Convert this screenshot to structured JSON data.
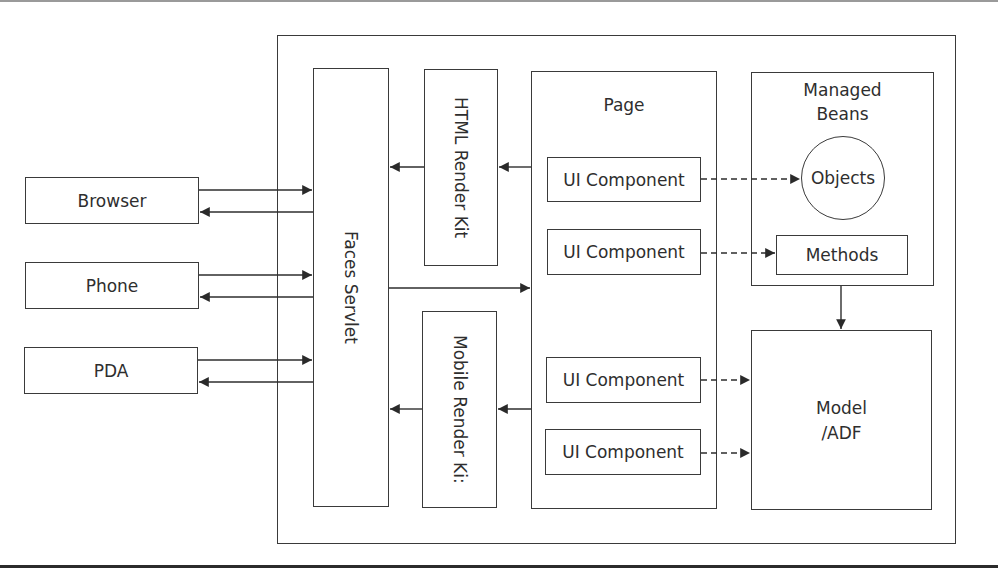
{
  "diagram": {
    "clients": [
      {
        "id": "browser",
        "label": "Browser"
      },
      {
        "id": "phone",
        "label": "Phone"
      },
      {
        "id": "pda",
        "label": "PDA"
      }
    ],
    "faces_servlet": {
      "label": "Faces Servlet"
    },
    "render_kits": [
      {
        "id": "html",
        "label": "HTML Render Kit"
      },
      {
        "id": "mobile",
        "label": "Mobile Render Ki:"
      }
    ],
    "page": {
      "label": "Page",
      "components": [
        {
          "label": "UI Component"
        },
        {
          "label": "UI Component"
        },
        {
          "label": "UI Component"
        },
        {
          "label": "UI Component"
        }
      ]
    },
    "managed_beans": {
      "label_line1": "Managed",
      "label_line2": "Beans",
      "objects_label": "Objects",
      "methods_label": "Methods"
    },
    "model": {
      "label_line1": "Model",
      "label_line2": "/ADF"
    },
    "colors": {
      "stroke": "#3a3a3a",
      "text": "#2e2e2e",
      "background": "#ffffff"
    }
  }
}
